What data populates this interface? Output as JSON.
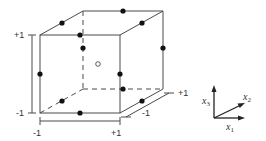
{
  "diagram": {
    "type": "3d-cube-design-points",
    "colors": {
      "line": "#4a4a4a",
      "point": "#111111",
      "background": "#ffffff"
    },
    "x3_axis": {
      "top_label": "+1",
      "bottom_label": "-1"
    },
    "x1_axis": {
      "left_label": "-1",
      "right_label": "+1"
    },
    "x2_axis": {
      "near_label": "-1",
      "far_label": "+1"
    },
    "legend_axes": {
      "x1": {
        "var": "x",
        "sub": "1"
      },
      "x2": {
        "var": "x",
        "sub": "2"
      },
      "x3": {
        "var": "x",
        "sub": "3"
      }
    },
    "points": {
      "filled_count": 12,
      "open_count": 1,
      "description": "edge midpoints (filled) and center point (open)"
    }
  }
}
